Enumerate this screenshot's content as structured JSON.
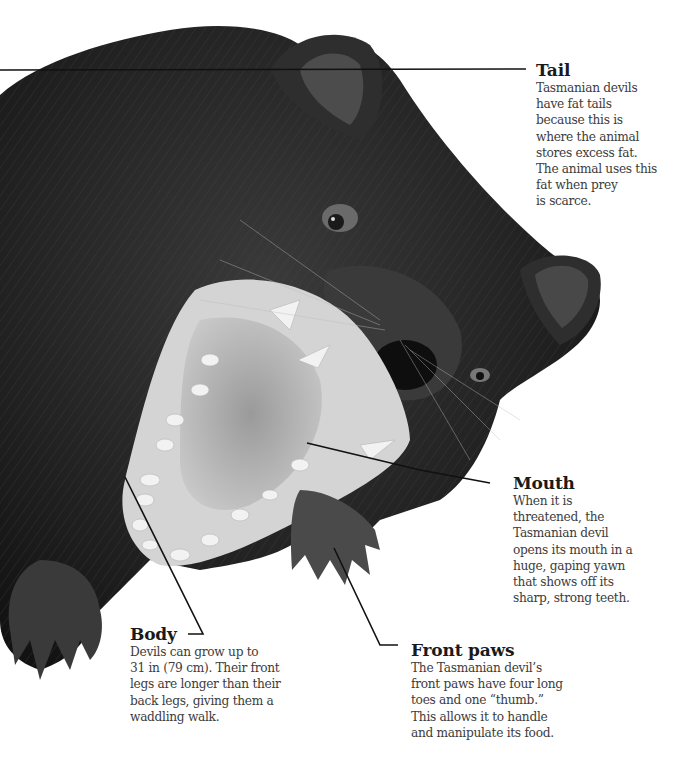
{
  "diagram": {
    "subject": "Tasmanian devil",
    "background_color": "#ffffff",
    "fur_color": "#1c1c1c",
    "leader_line_color": "#111111"
  },
  "callouts": {
    "tail": {
      "title": "Tail",
      "text": "Tasmanian devils\nhave fat tails\nbecause this is\nwhere the animal\nstores excess fat.\nThe animal uses this\nfat when prey\nis scarce."
    },
    "mouth": {
      "title": "Mouth",
      "text": "When it is\nthreatened, the\nTasmanian devil\nopens its mouth in a\nhuge, gaping yawn\nthat shows off its\nsharp, strong teeth."
    },
    "body": {
      "title": "Body",
      "text": "Devils can grow up to\n31 in (79 cm). Their front\nlegs are longer than their\nback legs, giving them a\nwaddling walk."
    },
    "front_paws": {
      "title": "Front paws",
      "text": "The Tasmanian devil’s\nfront paws have four long\ntoes and one “thumb.”\nThis allows it to handle\nand manipulate its food."
    }
  }
}
